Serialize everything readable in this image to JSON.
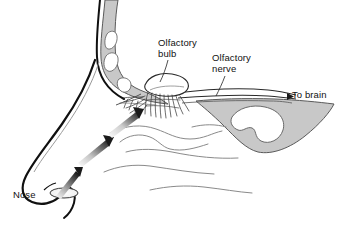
{
  "figure": {
    "type": "anatomical-diagram",
    "background_color": "#ffffff",
    "ink_color": "#111111",
    "bone_fill_color": "#c8c8c8",
    "bone_stroke_color": "#555555",
    "cavity_fill_color": "#ffffff",
    "turbinate_line_color": "#8a8a8a",
    "arrow_color": "#1a1a1a",
    "arrow_shadow_color": "#bdbdbd"
  },
  "labels": {
    "olfactory_bulb": "Olfactory\nbulb",
    "olfactory_bulb_line1": "Olfactory",
    "olfactory_bulb_line2": "bulb",
    "olfactory_nerve": "Olfactory\nnerve",
    "olfactory_nerve_line1": "Olfactory",
    "olfactory_nerve_line2": "nerve",
    "to_brain": "To brain",
    "nose": "Nose"
  },
  "structures": [
    {
      "name": "ethmoid-bone",
      "description": "Shaded bone with three white air-cell cavities, upper left"
    },
    {
      "name": "olfactory-bulb",
      "description": "Elongated oval body above the cribriform plate"
    },
    {
      "name": "olfactory-nerve-filaments",
      "description": "Fine hair-like nerve fibres descending from the bulb into the nasal roof"
    },
    {
      "name": "olfactory-nerve-tract",
      "description": "Two converging lines running right toward the brain"
    },
    {
      "name": "sphenoid-structure",
      "description": "Curved shaded body with hook-shaped white cavity, right side"
    },
    {
      "name": "nasal-turbinates",
      "description": "Wavy grey contour lines filling the nasal cavity"
    },
    {
      "name": "nose-profile",
      "description": "Heavy dark outline of the external nose"
    },
    {
      "name": "nostril",
      "description": "Small ellipse at the base of the nose"
    }
  ],
  "airflow_arrows": [
    {
      "name": "airflow-arrow-nostril",
      "direction": "up-right",
      "description": "Air entering the nostril"
    },
    {
      "name": "airflow-arrow-lower",
      "direction": "up-right",
      "description": "Air rising through the nasal cavity"
    },
    {
      "name": "airflow-arrow-upper",
      "direction": "up-right",
      "description": "Air reaching the olfactory epithelium"
    }
  ],
  "leader_lines": [
    {
      "name": "leader-olfactory-bulb",
      "from": "Olfactory bulb label",
      "to": "olfactory bulb"
    },
    {
      "name": "leader-olfactory-nerve",
      "from": "Olfactory nerve label",
      "to": "olfactory nerve tract"
    }
  ]
}
